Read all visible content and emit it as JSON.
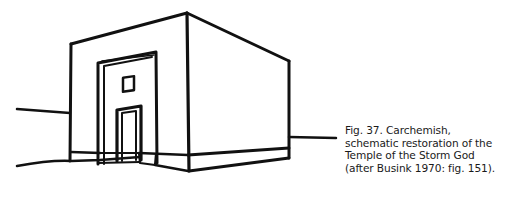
{
  "figure": {
    "stroke_color": "#111111",
    "background": "#ffffff"
  },
  "caption": {
    "lines": [
      "Fig. 37.  Carchemish,",
      "schematic restoration of the",
      "Temple of the Storm God",
      "(after Busink 1970: fig. 151)."
    ]
  }
}
